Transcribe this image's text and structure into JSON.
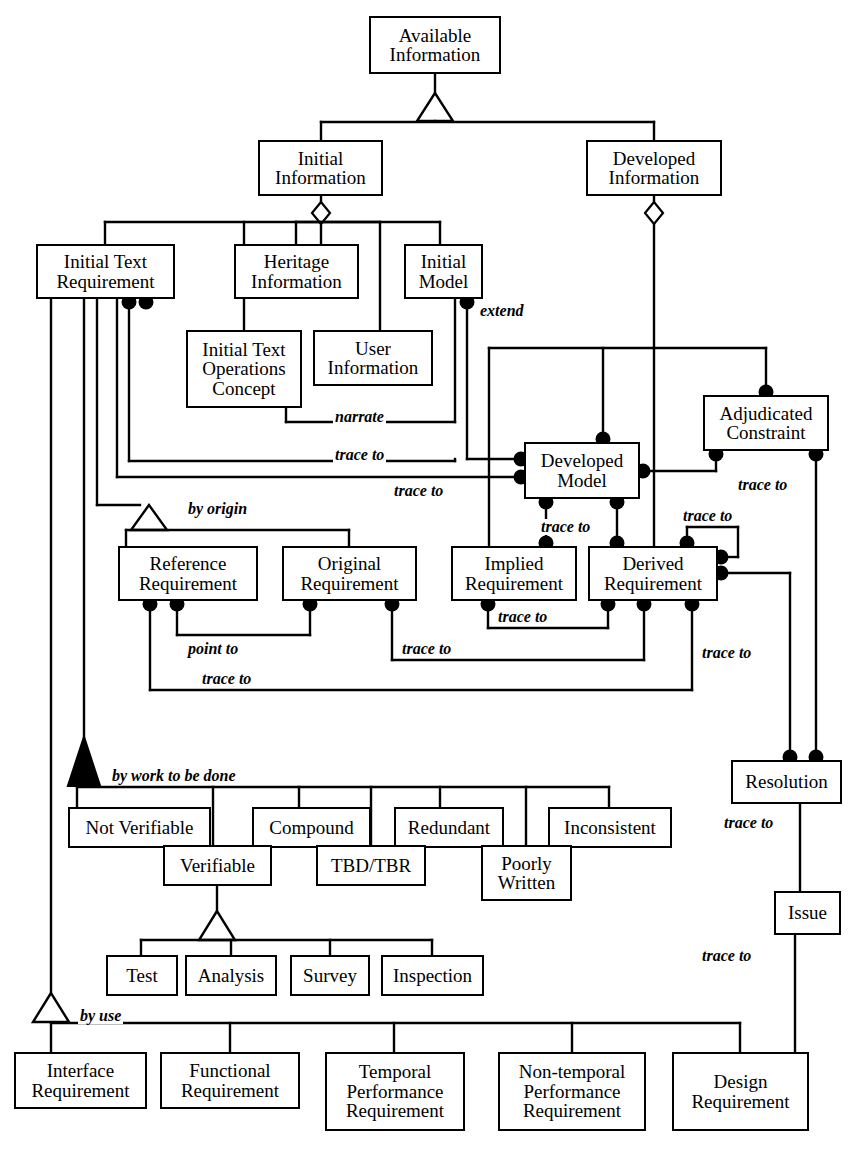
{
  "diagram": {
    "kind": "uml-class-diagram",
    "stroke_color": "#000000",
    "background_color": "#ffffff"
  },
  "nodes": [
    {
      "id": "available-information",
      "label": "Available\nInformation",
      "x": 369,
      "y": 16,
      "w": 132,
      "h": 58
    },
    {
      "id": "initial-information",
      "label": "Initial\nInformation",
      "x": 258,
      "y": 140,
      "w": 125,
      "h": 56
    },
    {
      "id": "developed-information",
      "label": "Developed\nInformation",
      "x": 586,
      "y": 140,
      "w": 136,
      "h": 56
    },
    {
      "id": "initial-text-requirement",
      "label": "Initial Text\nRequirement",
      "x": 36,
      "y": 244,
      "w": 139,
      "h": 55
    },
    {
      "id": "heritage-information",
      "label": "Heritage\nInformation",
      "x": 234,
      "y": 244,
      "w": 125,
      "h": 55
    },
    {
      "id": "initial-model",
      "label": "Initial\nModel",
      "x": 404,
      "y": 244,
      "w": 79,
      "h": 55
    },
    {
      "id": "initial-text-operations-concept",
      "label": "Initial Text\nOperations\nConcept",
      "x": 186,
      "y": 330,
      "w": 116,
      "h": 78
    },
    {
      "id": "user-information",
      "label": "User\nInformation",
      "x": 313,
      "y": 330,
      "w": 120,
      "h": 56
    },
    {
      "id": "adjudicated-constraint",
      "label": "Adjudicated\nConstraint",
      "x": 703,
      "y": 395,
      "w": 126,
      "h": 56
    },
    {
      "id": "developed-model",
      "label": "Developed\nModel",
      "x": 524,
      "y": 442,
      "w": 116,
      "h": 57
    },
    {
      "id": "reference-requirement",
      "label": "Reference\nRequirement",
      "x": 118,
      "y": 546,
      "w": 140,
      "h": 55
    },
    {
      "id": "original-requirement",
      "label": "Original\nRequirement",
      "x": 282,
      "y": 546,
      "w": 135,
      "h": 55
    },
    {
      "id": "implied-requirement",
      "label": "Implied\nRequirement",
      "x": 451,
      "y": 546,
      "w": 126,
      "h": 55
    },
    {
      "id": "derived-requirement",
      "label": "Derived\nRequirement",
      "x": 588,
      "y": 546,
      "w": 130,
      "h": 55
    },
    {
      "id": "resolution",
      "label": "Resolution",
      "x": 731,
      "y": 760,
      "w": 111,
      "h": 44
    },
    {
      "id": "issue",
      "label": "Issue",
      "x": 774,
      "y": 891,
      "w": 67,
      "h": 44
    },
    {
      "id": "not-verifiable",
      "label": "Not Verifiable",
      "x": 68,
      "y": 807,
      "w": 143,
      "h": 41
    },
    {
      "id": "compound",
      "label": "Compound",
      "x": 252,
      "y": 807,
      "w": 119,
      "h": 41
    },
    {
      "id": "redundant",
      "label": "Redundant",
      "x": 394,
      "y": 807,
      "w": 110,
      "h": 41
    },
    {
      "id": "inconsistent",
      "label": "Inconsistent",
      "x": 548,
      "y": 807,
      "w": 124,
      "h": 41
    },
    {
      "id": "verifible",
      "label": "Verifiable",
      "x": 163,
      "y": 845,
      "w": 109,
      "h": 41
    },
    {
      "id": "tbd-tbr",
      "label": "TBD/TBR",
      "x": 316,
      "y": 845,
      "w": 110,
      "h": 41
    },
    {
      "id": "poorly-written",
      "label": "Poorly\nWritten",
      "x": 481,
      "y": 845,
      "w": 91,
      "h": 56
    },
    {
      "id": "test",
      "label": "Test",
      "x": 106,
      "y": 955,
      "w": 72,
      "h": 41
    },
    {
      "id": "analysis",
      "label": "Analysis",
      "x": 185,
      "y": 955,
      "w": 92,
      "h": 41
    },
    {
      "id": "survey",
      "label": "Survey",
      "x": 290,
      "y": 955,
      "w": 80,
      "h": 41
    },
    {
      "id": "inspection",
      "label": "Inspection",
      "x": 381,
      "y": 955,
      "w": 103,
      "h": 41
    },
    {
      "id": "interface-requirement",
      "label": "Interface\nRequirement",
      "x": 14,
      "y": 1052,
      "w": 133,
      "h": 57
    },
    {
      "id": "functional-requirement",
      "label": "Functional\nRequirement",
      "x": 160,
      "y": 1052,
      "w": 140,
      "h": 57
    },
    {
      "id": "temporal-performance-requirement",
      "label": "Temporal\nPerformance\nRequirement",
      "x": 325,
      "y": 1052,
      "w": 140,
      "h": 79
    },
    {
      "id": "non-temporal-performance-requirement",
      "label": "Non-temporal\nPerformance\nRequirement",
      "x": 498,
      "y": 1052,
      "w": 148,
      "h": 79
    },
    {
      "id": "design-requirement",
      "label": "Design\nRequirement",
      "x": 672,
      "y": 1052,
      "w": 137,
      "h": 79
    }
  ],
  "edge_labels": [
    {
      "id": "extend",
      "text": "extend",
      "x": 478,
      "y": 303
    },
    {
      "id": "narrate",
      "text": "narrate",
      "x": 333,
      "y": 409
    },
    {
      "id": "trace-to-initial-text-op",
      "text": "trace to",
      "x": 333,
      "y": 447
    },
    {
      "id": "trace-to-initial-text-req",
      "text": "trace to",
      "x": 392,
      "y": 483
    },
    {
      "id": "trace-to-adjudicated",
      "text": "trace to",
      "x": 736,
      "y": 477
    },
    {
      "id": "by-origin",
      "text": "by origin",
      "x": 186,
      "y": 501
    },
    {
      "id": "trace-to-developed-implied",
      "text": "trace to",
      "x": 539,
      "y": 519
    },
    {
      "id": "trace-to-derived-top",
      "text": "trace to",
      "x": 681,
      "y": 513
    },
    {
      "id": "point-to",
      "text": "point to",
      "x": 186,
      "y": 646
    },
    {
      "id": "trace-to-implied-derived",
      "text": "trace to",
      "x": 496,
      "y": 620
    },
    {
      "id": "trace-to-original",
      "text": "trace to",
      "x": 388,
      "y": 646
    },
    {
      "id": "trace-to-reference",
      "text": "trace to",
      "x": 200,
      "y": 686
    },
    {
      "id": "trace-to-resolution",
      "text": "trace to",
      "x": 700,
      "y": 659
    },
    {
      "id": "by-work-to-be-done",
      "text": "by work to be done",
      "x": 140,
      "y": 777
    },
    {
      "id": "trace-to-issue",
      "text": "trace to",
      "x": 725,
      "y": 832
    },
    {
      "id": "trace-to-design",
      "text": "trace to",
      "x": 700,
      "y": 955
    },
    {
      "id": "by-use",
      "text": "by use",
      "x": 62,
      "y": 1026
    }
  ],
  "relationships": [
    {
      "from": "available-information",
      "to": [
        "initial-information",
        "developed-information"
      ],
      "type": "generalization"
    },
    {
      "from": "initial-information",
      "to": [
        "initial-text-requirement",
        "heritage-information",
        "initial-model",
        "initial-text-operations-concept",
        "user-information"
      ],
      "type": "aggregation"
    },
    {
      "from": "developed-information",
      "to": [
        "developed-model",
        "adjudicated-constraint",
        "implied-requirement",
        "derived-requirement"
      ],
      "type": "aggregation"
    },
    {
      "from": "initial-model",
      "to": [
        "developed-model"
      ],
      "type": "association",
      "label": "extend"
    },
    {
      "from": "initial-text-operations-concept",
      "to": [
        "initial-text-requirement"
      ],
      "type": "association",
      "label": "narrate"
    },
    {
      "from": "initial-text-requirement",
      "to": [
        "reference-requirement",
        "original-requirement"
      ],
      "type": "generalization",
      "label": "by origin"
    },
    {
      "from": "initial-text-requirement",
      "to": [
        "not-verifiable",
        "verifible",
        "compound",
        "tbd-tbr",
        "redundant",
        "poorly-written",
        "inconsistent"
      ],
      "type": "composition",
      "label": "by work to be done"
    },
    {
      "from": "verifible",
      "to": [
        "test",
        "analysis",
        "survey",
        "inspection"
      ],
      "type": "generalization"
    },
    {
      "from": "initial-text-requirement",
      "to": [
        "interface-requirement",
        "functional-requirement",
        "temporal-performance-requirement",
        "non-temporal-performance-requirement",
        "design-requirement"
      ],
      "type": "generalization",
      "label": "by use"
    },
    {
      "from": "developed-model",
      "to": [
        "implied-requirement",
        "derived-requirement"
      ],
      "type": "association",
      "label": "trace to"
    },
    {
      "from": "adjudicated-constraint",
      "to": [
        "developed-model",
        "resolution"
      ],
      "type": "association",
      "label": "trace to"
    },
    {
      "from": "reference-requirement",
      "to": [
        "original-requirement"
      ],
      "type": "association",
      "label": "point to"
    },
    {
      "from": "derived-requirement",
      "to": [
        "resolution"
      ],
      "type": "association",
      "label": "trace to"
    },
    {
      "from": "resolution",
      "to": [
        "issue"
      ],
      "type": "association",
      "label": "trace to"
    },
    {
      "from": "issue",
      "to": [
        "design-requirement"
      ],
      "type": "association",
      "label": "trace to"
    }
  ]
}
